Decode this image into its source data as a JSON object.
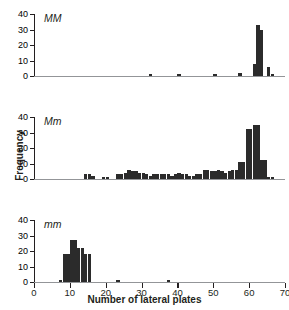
{
  "chart_data": {
    "type": "bar",
    "title": "",
    "xlabel": "Number of lateral plates",
    "ylabel": "Frequency",
    "xlim": [
      0,
      70
    ],
    "ylim": [
      0,
      40
    ],
    "xticks": [
      0,
      10,
      20,
      30,
      40,
      50,
      60,
      70
    ],
    "yticks": [
      0,
      10,
      20,
      30,
      40
    ],
    "grid": false,
    "legend": null,
    "bin_width": 1,
    "bar_color": "#2b2b2b",
    "panels": [
      {
        "label": "MM",
        "annotation": "MM",
        "x": [
          32,
          40,
          50,
          57,
          58,
          59,
          60,
          61,
          62,
          63,
          64,
          65,
          66
        ],
        "values": [
          1,
          1,
          1,
          2,
          0,
          0,
          0,
          8,
          33,
          30,
          0,
          6,
          1
        ]
      },
      {
        "label": "Mm",
        "annotation": "Mm",
        "x": [
          14,
          15,
          16,
          19,
          20,
          23,
          24,
          25,
          26,
          27,
          28,
          29,
          30,
          31,
          32,
          33,
          34,
          35,
          36,
          37,
          38,
          39,
          40,
          41,
          42,
          43,
          44,
          45,
          46,
          47,
          48,
          49,
          50,
          51,
          52,
          53,
          54,
          55,
          56,
          57,
          58,
          59,
          60,
          61,
          62,
          63,
          64,
          65,
          66
        ],
        "values": [
          3,
          3,
          2,
          1,
          1,
          3,
          3,
          4,
          6,
          5,
          5,
          4,
          4,
          3,
          2,
          3,
          3,
          3,
          3,
          3,
          2,
          3,
          4,
          3,
          3,
          2,
          2,
          3,
          3,
          6,
          6,
          5,
          5,
          6,
          5,
          4,
          5,
          6,
          6,
          11,
          11,
          32,
          32,
          35,
          35,
          12,
          12,
          1,
          1
        ]
      },
      {
        "label": "mm",
        "annotation": "mm",
        "x": [
          7,
          8,
          9,
          10,
          11,
          12,
          13,
          14,
          15,
          23,
          37
        ],
        "values": [
          1,
          18,
          18,
          27,
          27,
          22,
          22,
          18,
          18,
          1,
          1
        ]
      }
    ]
  }
}
